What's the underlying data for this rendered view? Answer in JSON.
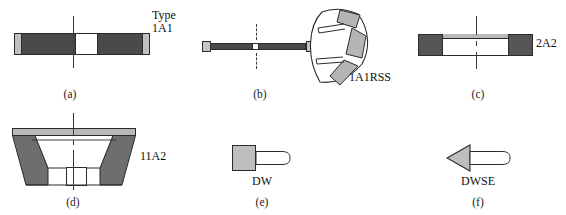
{
  "figure": {
    "background": "#ffffff",
    "colors": {
      "abrasive_dark": "#4a4a4a",
      "metal_light": "#b9b9b9",
      "body_white": "#ffffff",
      "outline": "#2b2b2b",
      "text": "#111111"
    }
  },
  "items": [
    {
      "caption": "(a)",
      "type_label_line1": "Type",
      "type_label_line2": "1A1",
      "shape": "straight-wheel-cross-section",
      "description": "Straight diamond wheel cross-section with dark abrasive rims, white core and light end caps"
    },
    {
      "caption": "(b)",
      "type_label_line1": "1A1RSS",
      "type_label_line2": "",
      "shape": "thin-bar-with-segmented-side-view",
      "description": "Thin straight wheel edge view with segmented side view showing three abrasive segments and relief slots"
    },
    {
      "caption": "(c)",
      "type_label_line1": "2A2",
      "type_label_line2": "",
      "shape": "cup-wheel-cross-section",
      "description": "Cup wheel cross-section with dark abrasive blocks at both ends and light rail on top"
    },
    {
      "caption": "(d)",
      "type_label_line1": "11A2",
      "type_label_line2": "",
      "shape": "flaring-cup-wheel-cross-section",
      "description": "Flaring cup wheel trapezoid cross-section with grey walls and white inner cavity"
    },
    {
      "caption": "(e)",
      "type_label_line1": "DW",
      "type_label_line2": "",
      "shape": "dressing-tool-block-with-shaft",
      "description": "Dressing wheel: grey square block with white rounded shaft"
    },
    {
      "caption": "(f)",
      "type_label_line1": "DWSE",
      "type_label_line2": "",
      "shape": "dressing-tool-arrowhead-with-shaft",
      "description": "Dressing wheel single edge: grey triangular arrowhead pointing left with white shaft"
    }
  ]
}
